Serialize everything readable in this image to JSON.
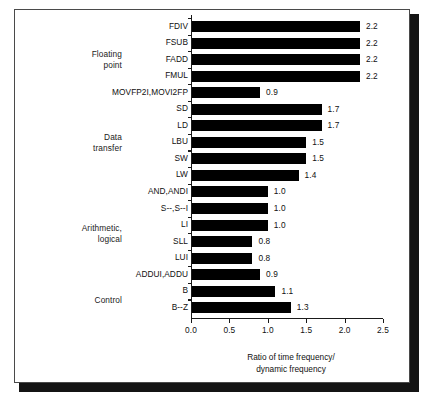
{
  "chart_data": {
    "type": "bar",
    "orientation": "horizontal",
    "title": "",
    "xlabel": "Ratio of time frequency/\ndynamic frequency",
    "ylabel": "",
    "xlim": [
      0.0,
      2.5
    ],
    "grid": false,
    "legend": "none",
    "xticks": [
      "0.0",
      "0.5",
      "1.0",
      "1.5",
      "2.0",
      "2.5"
    ],
    "xtick_values": [
      0.0,
      0.5,
      1.0,
      1.5,
      2.0,
      2.5
    ],
    "bar_color": "#000000",
    "categories": [
      "FDIV",
      "FSUB",
      "FADD",
      "FMUL",
      "MOVFP2I,MOVI2FP",
      "SD",
      "LD",
      "LBU",
      "SW",
      "LW",
      "AND,ANDI",
      "S--,S--I",
      "LI",
      "SLL",
      "LUI",
      "ADDUI,ADDU",
      "B",
      "B--Z"
    ],
    "values": [
      2.2,
      2.2,
      2.2,
      2.2,
      0.9,
      1.7,
      1.7,
      1.5,
      1.5,
      1.4,
      1.0,
      1.0,
      1.0,
      0.8,
      0.8,
      0.9,
      1.1,
      1.3
    ],
    "value_labels": [
      "2.2",
      "2.2",
      "2.2",
      "2.2",
      "0.9",
      "1.7",
      "1.7",
      "1.5",
      "1.5",
      "1.4",
      "1.0",
      "1.0",
      "1.0",
      "0.8",
      "0.8",
      "0.9",
      "1.1",
      "1.3"
    ],
    "groups": [
      {
        "label": "Floating\npoint",
        "start_index": 0,
        "end_index": 4
      },
      {
        "label": "Data\ntransfer",
        "start_index": 5,
        "end_index": 9
      },
      {
        "label": "Arithmetic,\nlogical",
        "start_index": 10,
        "end_index": 15
      },
      {
        "label": "Control",
        "start_index": 16,
        "end_index": 17
      }
    ]
  }
}
